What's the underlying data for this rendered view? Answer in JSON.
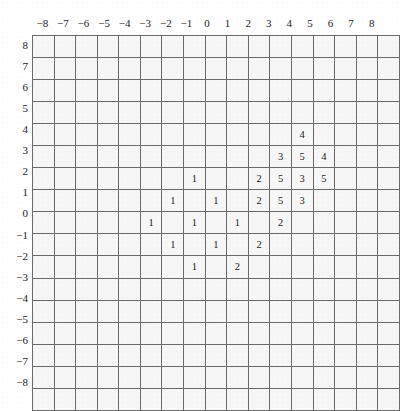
{
  "figure": {
    "title": "",
    "background_color": "#fefefe"
  },
  "axes": {
    "x_labels": [
      "−8",
      "−7",
      "−6",
      "−5",
      "−4",
      "−3",
      "−2",
      "−1",
      "0",
      "1",
      "2",
      "3",
      "4",
      "5",
      "6",
      "7",
      "8"
    ],
    "y_labels": [
      "8",
      "7",
      "6",
      "5",
      "4",
      "3",
      "2",
      "1",
      "0",
      "−1",
      "−2",
      "−3",
      "−4",
      "−5",
      "−6",
      "−7",
      "−8"
    ],
    "x_min": -8,
    "x_max": 8,
    "y_min": -8,
    "y_max": 8,
    "grid": true
  },
  "colors": {
    "empty": "#f7f7f7",
    "dark": "#5d5d5d",
    "mid_gray": "#a6a6a6",
    "white": "#fbfbfb",
    "dotted_light": "#eeeeee",
    "dotted_dark": "#c9c9c9",
    "grid_line": "#6b6b6b",
    "border": "#4a4a4a",
    "text": "#1a1a1a"
  },
  "chart_data": {
    "type": "heatmap",
    "title": "",
    "xlabel": "",
    "ylabel": "",
    "xlim": [
      -8,
      8
    ],
    "ylim": [
      -8,
      8
    ],
    "grid": true,
    "legend": "none",
    "x_ticks": [
      -8,
      -7,
      -6,
      -5,
      -4,
      -3,
      -2,
      -1,
      0,
      1,
      2,
      3,
      4,
      5,
      6,
      7,
      8
    ],
    "y_ticks": [
      8,
      7,
      6,
      5,
      4,
      3,
      2,
      1,
      0,
      -1,
      -2,
      -3,
      -4,
      -5,
      -6,
      -7,
      -8
    ],
    "cells": [
      {
        "x": 4,
        "y": 4,
        "label": "4",
        "fill": "dotted_light"
      },
      {
        "x": 3,
        "y": 3,
        "label": "3",
        "fill": "dotted_light"
      },
      {
        "x": 4,
        "y": 3,
        "label": "5",
        "fill": "white"
      },
      {
        "x": 5,
        "y": 3,
        "label": "4",
        "fill": "dotted_light"
      },
      {
        "x": -1,
        "y": 2,
        "label": "1",
        "fill": "dark"
      },
      {
        "x": 2,
        "y": 2,
        "label": "2",
        "fill": "mid_gray"
      },
      {
        "x": 3,
        "y": 2,
        "label": "5",
        "fill": "white"
      },
      {
        "x": 4,
        "y": 2,
        "label": "3",
        "fill": "dotted_dark"
      },
      {
        "x": 5,
        "y": 2,
        "label": "5",
        "fill": "white"
      },
      {
        "x": -2,
        "y": 1,
        "label": "1",
        "fill": "dark"
      },
      {
        "x": 0,
        "y": 1,
        "label": "1",
        "fill": "dark"
      },
      {
        "x": 2,
        "y": 1,
        "label": "2",
        "fill": "dotted_dark"
      },
      {
        "x": 3,
        "y": 1,
        "label": "5",
        "fill": "white"
      },
      {
        "x": 4,
        "y": 1,
        "label": "3",
        "fill": "dotted_dark"
      },
      {
        "x": -3,
        "y": 0,
        "label": "1",
        "fill": "dark"
      },
      {
        "x": -1,
        "y": 0,
        "label": "1",
        "fill": "dark"
      },
      {
        "x": 1,
        "y": 0,
        "label": "1",
        "fill": "dark"
      },
      {
        "x": 3,
        "y": 0,
        "label": "2",
        "fill": "dotted_dark"
      },
      {
        "x": -2,
        "y": -1,
        "label": "1",
        "fill": "dark"
      },
      {
        "x": 0,
        "y": -1,
        "label": "1",
        "fill": "dark"
      },
      {
        "x": 2,
        "y": -1,
        "label": "2",
        "fill": "dotted_dark"
      },
      {
        "x": -1,
        "y": -2,
        "label": "1",
        "fill": "dark"
      },
      {
        "x": 1,
        "y": -2,
        "label": "2",
        "fill": "dotted_dark"
      }
    ]
  }
}
